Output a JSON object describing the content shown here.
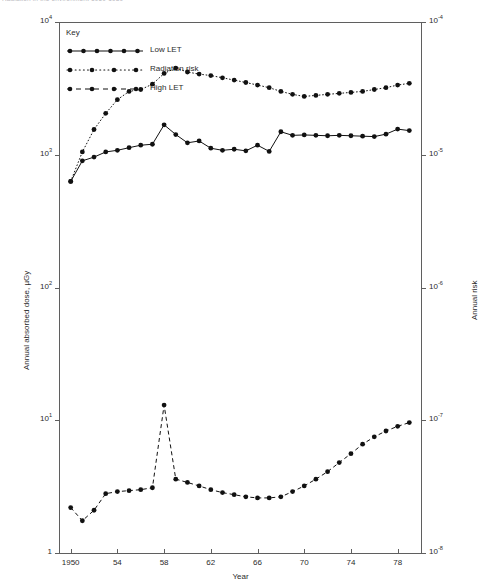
{
  "top_caption": "Radiation in the environment 1950-1980",
  "figure": {
    "xaxis": {
      "title": "Year",
      "ticks": [
        {
          "label": "1950",
          "value": 1950
        },
        {
          "label": "54",
          "value": 1954
        },
        {
          "label": "58",
          "value": 1958
        },
        {
          "label": "62",
          "value": 1962
        },
        {
          "label": "66",
          "value": 1966
        },
        {
          "label": "70",
          "value": 1970
        },
        {
          "label": "74",
          "value": 1974
        },
        {
          "label": "78",
          "value": 1978
        }
      ],
      "range": [
        1949,
        1980
      ]
    },
    "yaxis_left": {
      "title": "Annual absorbed dose, µGy",
      "ticks": [
        {
          "mantissa": "10",
          "exponent": "4",
          "value": 10000
        },
        {
          "mantissa": "10",
          "exponent": "3",
          "value": 1000
        },
        {
          "mantissa": "10",
          "exponent": "2",
          "value": 100
        },
        {
          "mantissa": "10",
          "exponent": "1",
          "value": 10
        },
        {
          "mantissa": "1",
          "exponent": "",
          "value": 1
        }
      ],
      "range": [
        1,
        10000
      ],
      "scale": "log"
    },
    "yaxis_right": {
      "title": "Annual risk",
      "ticks": [
        {
          "mantissa": "10",
          "exponent": "-4",
          "value": 0.0001
        },
        {
          "mantissa": "10",
          "exponent": "-5",
          "value": 1e-05
        },
        {
          "mantissa": "10",
          "exponent": "-6",
          "value": 1e-06
        },
        {
          "mantissa": "10",
          "exponent": "-7",
          "value": 1e-07
        },
        {
          "mantissa": "10",
          "exponent": "-8",
          "value": 1e-08
        }
      ],
      "range": [
        1e-08,
        0.0001
      ],
      "scale": "log"
    },
    "legend": {
      "title": "Key",
      "entries": [
        {
          "label": "Low LET",
          "style": "solid",
          "marker": "filled-circle",
          "color": "#111111"
        },
        {
          "label": "Radiation risk",
          "style": "dotted",
          "marker": "filled-circle",
          "color": "#111111"
        },
        {
          "label": "High LET",
          "style": "dashed",
          "marker": "filled-circle",
          "color": "#111111"
        }
      ]
    }
  },
  "chart_data": {
    "type": "line",
    "title": "",
    "xlabel": "Year",
    "ylabel": "Annual absorbed dose, µGy",
    "ylabel_secondary": "Annual risk",
    "xlim": [
      1949,
      1980
    ],
    "ylim": [
      1,
      10000
    ],
    "ylim_secondary": [
      1e-08,
      0.0001
    ],
    "yscale": "log",
    "grid": false,
    "legend_position": "top-left",
    "x": [
      1950,
      1951,
      1952,
      1953,
      1954,
      1955,
      1956,
      1957,
      1958,
      1959,
      1960,
      1961,
      1962,
      1963,
      1964,
      1965,
      1966,
      1967,
      1968,
      1969,
      1970,
      1971,
      1972,
      1973,
      1974,
      1975,
      1976,
      1977,
      1978,
      1979
    ],
    "series": [
      {
        "name": "Low LET",
        "style": "solid",
        "axis": "left",
        "units": "µGy",
        "values": [
          630,
          900,
          960,
          1050,
          1080,
          1130,
          1180,
          1200,
          1680,
          1420,
          1230,
          1270,
          1120,
          1080,
          1100,
          1070,
          1180,
          1060,
          1490,
          1400,
          1410,
          1400,
          1390,
          1400,
          1390,
          1380,
          1370,
          1430,
          1560,
          1520
        ]
      },
      {
        "name": "Radiation risk",
        "style": "dotted",
        "axis": "right",
        "units": "annual risk",
        "values": [
          6.3e-06,
          1.05e-05,
          1.55e-05,
          2.05e-05,
          2.6e-05,
          3e-05,
          3.1e-05,
          3.4e-05,
          4.1e-05,
          4.5e-05,
          4.2e-05,
          4.05e-05,
          3.95e-05,
          3.8e-05,
          3.65e-05,
          3.5e-05,
          3.35e-05,
          3.2e-05,
          3e-05,
          2.85e-05,
          2.75e-05,
          2.8e-05,
          2.85e-05,
          2.9e-05,
          2.95e-05,
          3e-05,
          3.1e-05,
          3.2e-05,
          3.35e-05,
          3.45e-05
        ]
      },
      {
        "name": "High LET",
        "style": "dashed",
        "axis": "left",
        "units": "µGy",
        "values": [
          2.2,
          1.75,
          2.1,
          2.8,
          2.9,
          2.95,
          3.0,
          3.1,
          13.0,
          3.6,
          3.4,
          3.2,
          3.0,
          2.85,
          2.75,
          2.65,
          2.6,
          2.6,
          2.65,
          2.9,
          3.2,
          3.6,
          4.1,
          4.8,
          5.6,
          6.6,
          7.5,
          8.3,
          9.0,
          9.6
        ]
      }
    ]
  }
}
